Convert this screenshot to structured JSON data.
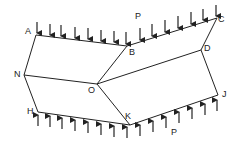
{
  "diagram": {
    "labels": {
      "A": "A",
      "B": "B",
      "C": "C",
      "D": "D",
      "N": "N",
      "O": "O",
      "H": "H",
      "K": "K",
      "J": "J",
      "P_top": "P",
      "P_bottom": "P"
    },
    "vertices": {
      "A": [
        36,
        35
      ],
      "B": [
        127,
        46
      ],
      "C": [
        217,
        18
      ],
      "D": [
        201,
        50
      ],
      "N": [
        24,
        75
      ],
      "O": [
        97,
        84
      ],
      "H": [
        38,
        112
      ],
      "K": [
        130,
        125
      ],
      "J": [
        218,
        95
      ]
    },
    "edges": [
      [
        "A",
        "B"
      ],
      [
        "B",
        "C"
      ],
      [
        "A",
        "N"
      ],
      [
        "N",
        "H"
      ],
      [
        "H",
        "K"
      ],
      [
        "K",
        "J"
      ],
      [
        "C",
        "D"
      ],
      [
        "D",
        "J"
      ],
      [
        "N",
        "O"
      ],
      [
        "O",
        "B"
      ],
      [
        "O",
        "D"
      ],
      [
        "O",
        "K"
      ]
    ],
    "load_top": "downward distributed load P on A-B-C",
    "load_bottom": "upward distributed load P on H-K-J",
    "line_color": "#222222"
  }
}
